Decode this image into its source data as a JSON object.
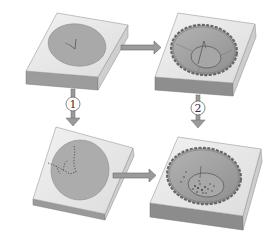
{
  "diagram": {
    "type": "process-flow",
    "colors": {
      "block_top": "#e8e8e8",
      "block_side_front": "#9a9a9a",
      "block_side_right": "#c8c8c8",
      "disc_fill": "#a9a9a9",
      "disc_edge": "#8a8a8a",
      "crater_rim": "#6e6e6e",
      "crater_fill": "#a3a3a3",
      "arrow_fill": "#8f8f8f",
      "arrow_edge": "#6a6a6a",
      "label_circle": "#ffffff",
      "label_stroke": "#6a6a6a"
    },
    "panels": [
      {
        "id": "top-left",
        "content": "flat disc with small V-shaped crack"
      },
      {
        "id": "top-right",
        "content": "crater with scalloped rim and inner ring, crack"
      },
      {
        "id": "bottom-left",
        "content": "flat disc with dotted crack branches"
      },
      {
        "id": "bottom-right",
        "content": "crater with scalloped rim, inner ring and scattered debris"
      }
    ],
    "steps": [
      {
        "label": "1",
        "from": "top-left",
        "to": "bottom-left",
        "direction": "down"
      },
      {
        "label": "2",
        "from": "top-right",
        "to": "bottom-right",
        "direction": "down"
      }
    ],
    "arrows": [
      {
        "from": "top-left",
        "to": "top-right",
        "direction": "right"
      },
      {
        "from": "bottom-left",
        "to": "bottom-right",
        "direction": "right"
      }
    ]
  }
}
